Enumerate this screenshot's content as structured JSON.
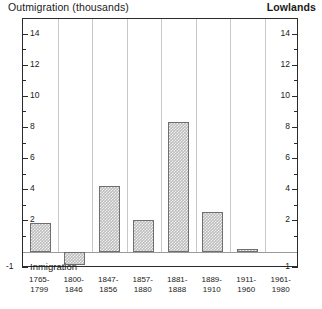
{
  "header": {
    "left_title": "Outmigration (thousands)",
    "right_title": "Lowlands"
  },
  "axis": {
    "bottom_caption": "Inmigration",
    "negative_tick_label": "-1",
    "y_major_labels": [
      "14",
      "12",
      "10",
      "8",
      "6",
      "4",
      "2"
    ],
    "y_left": {
      "t14": "14",
      "t12": "12",
      "t10": "10",
      "t8": "8",
      "t6": "6",
      "t4": "4",
      "t2": "2",
      "tm1": "-1"
    },
    "y_right": {
      "t14": "14",
      "t12": "12",
      "t10": "10",
      "t8": "8",
      "t6": "6",
      "t4": "4",
      "t2": "2",
      "tm1": "-1"
    }
  },
  "colors": {
    "bar_fill": "#bdbdbd",
    "bar_edge": "#6f6f6f",
    "frame": "#2b2b2b",
    "gridline": "#c9c9c9",
    "baseline": "#9a9a9a"
  },
  "chart_data": {
    "type": "bar",
    "title": "Outmigration (thousands)",
    "subtitle": "Lowlands",
    "xlabel": "",
    "ylabel": "Outmigration (thousands)",
    "ylim": [
      -1,
      15
    ],
    "grid": true,
    "legend": "none",
    "yticks": [
      -1,
      2,
      4,
      6,
      8,
      10,
      12,
      14
    ],
    "ytick_minor": [
      1,
      3,
      5,
      7,
      9,
      11,
      13,
      15
    ],
    "categories": [
      "1765-1799",
      "1800-1846",
      "1847-1856",
      "1857-1880",
      "1881-1888",
      "1889-1910",
      "1911-1960",
      "1961-1980"
    ],
    "categories_wrapped": [
      [
        "1765-",
        "1799"
      ],
      [
        "1800-",
        "1846"
      ],
      [
        "1847-",
        "1856"
      ],
      [
        "1857-",
        "1880"
      ],
      [
        "1881-",
        "1888"
      ],
      [
        "1889-",
        "1910"
      ],
      [
        "1911-",
        "1960"
      ],
      [
        "1961-",
        "1980"
      ]
    ],
    "values": [
      1.9,
      -0.8,
      4.3,
      2.1,
      8.4,
      2.6,
      0.2,
      0.0
    ],
    "annotations": [
      "Positive values indicate outmigration",
      "Negative values indicate inmigration"
    ]
  }
}
